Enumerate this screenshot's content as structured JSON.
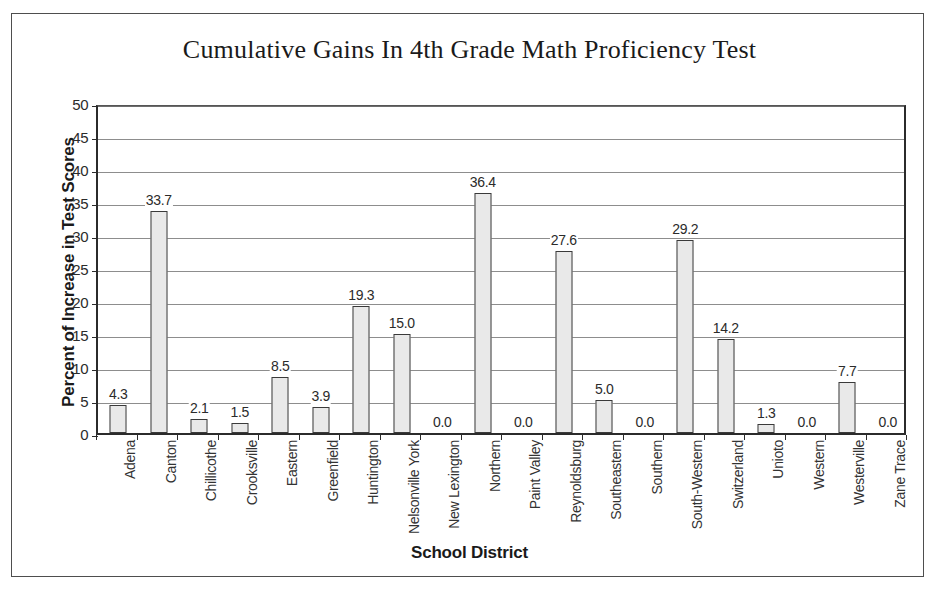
{
  "figure": {
    "title": "Cumulative Gains In 4th Grade Math Proficiency Test",
    "x_axis_title": "School District",
    "y_axis_title": "Percent of Increase in Test Scores"
  },
  "colors": {
    "bar_fill": "#e9e9e9",
    "bar_stroke": "#3a3a3a",
    "axis": "#2b2b2b",
    "gridline": "#8d8d8d",
    "frame": "#4e4e4e",
    "text": "#1a1a1a",
    "background": "#ffffff"
  },
  "chart_data": {
    "type": "bar",
    "title": "Cumulative Gains In 4th Grade Math Proficiency Test",
    "xlabel": "School District",
    "ylabel": "Percent of Increase in Test Scores",
    "ylim": [
      0,
      50
    ],
    "yticks": [
      0,
      5,
      10,
      15,
      20,
      25,
      30,
      35,
      40,
      45,
      50
    ],
    "ytick_labels": [
      "0",
      "5",
      "10",
      "15",
      "20",
      "25",
      "30",
      "35",
      "40",
      "45",
      "50"
    ],
    "grid": true,
    "legend": false,
    "orientation": "vertical",
    "data_labels": true,
    "categories": [
      "Adena",
      "Canton",
      "Chillicothe",
      "Crooksville",
      "Eastern",
      "Greenfield",
      "Huntington",
      "Nelsonville York",
      "New Lexington",
      "Northern",
      "Paint Valley",
      "Reynoldsburg",
      "Southeastern",
      "Southern",
      "South-Western",
      "Switzerland",
      "Unioto",
      "Western",
      "Westerville",
      "Zane Trace"
    ],
    "values": [
      4.3,
      33.7,
      2.1,
      1.5,
      8.5,
      3.9,
      19.3,
      15.0,
      0.0,
      36.4,
      0.0,
      27.6,
      5.0,
      0.0,
      29.2,
      14.2,
      1.3,
      0.0,
      7.7,
      0.0
    ],
    "value_labels": [
      "4.3",
      "33.7",
      "2.1",
      "1.5",
      "8.5",
      "3.9",
      "19.3",
      "15.0",
      "0.0",
      "36.4",
      "0.0",
      "27.6",
      "5.0",
      "0.0",
      "29.2",
      "14.2",
      "1.3",
      "0.0",
      "7.7",
      "0.0"
    ]
  }
}
